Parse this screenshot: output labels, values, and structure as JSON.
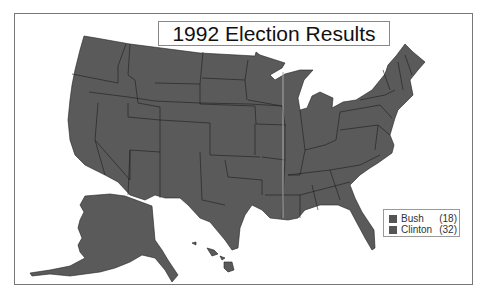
{
  "title": "1992 Election Results",
  "map": {
    "region": "United States",
    "fill_color": "#595959",
    "border_color": "#222222"
  },
  "legend": {
    "items": [
      {
        "label": "Bush",
        "count": "(18)",
        "color": "#555555"
      },
      {
        "label": "Clinton",
        "count": "(32)",
        "color": "#555555"
      }
    ]
  }
}
